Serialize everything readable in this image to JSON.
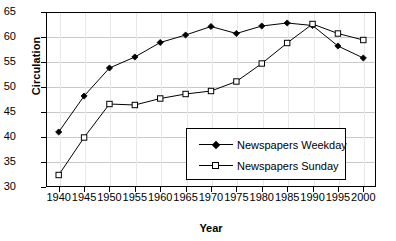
{
  "chart_data": {
    "type": "line",
    "title": "",
    "xlabel": "Year",
    "ylabel": "Circulation",
    "x": [
      1940,
      1945,
      1950,
      1955,
      1960,
      1965,
      1970,
      1975,
      1980,
      1985,
      1990,
      1995,
      2000
    ],
    "xticklabels": [
      "1940",
      "1945",
      "1950",
      "1955",
      "1960",
      "1965",
      "1970",
      "1975",
      "1980",
      "1985",
      "1990",
      "1995",
      "2000"
    ],
    "yticklabels": [
      "30",
      "35",
      "40",
      "45",
      "50",
      "55",
      "60",
      "65"
    ],
    "ylim": [
      30,
      65
    ],
    "xlim": [
      1937.5,
      2002.5
    ],
    "grid": true,
    "legend_position": "center-right",
    "series": [
      {
        "name": "Newspapers Weekday",
        "marker": "filled-diamond",
        "color": "#000000",
        "values": [
          41.0,
          48.2,
          53.8,
          56.0,
          58.9,
          60.4,
          62.1,
          60.7,
          62.2,
          62.8,
          62.3,
          58.2,
          55.8
        ]
      },
      {
        "name": "Newspapers Sunday",
        "marker": "open-square",
        "color": "#000000",
        "values": [
          32.4,
          39.9,
          46.6,
          46.4,
          47.7,
          48.6,
          49.2,
          51.1,
          54.7,
          58.8,
          62.6,
          60.7,
          59.4
        ]
      }
    ]
  },
  "legend": {
    "items": [
      {
        "label": "Newspapers Weekday"
      },
      {
        "label": "Newspapers Sunday"
      }
    ]
  }
}
